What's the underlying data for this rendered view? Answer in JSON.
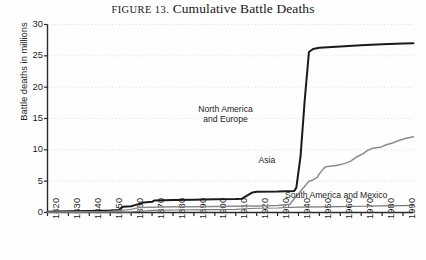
{
  "figure": {
    "title_prefix": "FIGURE 13.",
    "title_main": "Cumulative Battle Deaths"
  },
  "chart_data": {
    "type": "line",
    "title": "FIGURE 13. Cumulative Battle Deaths",
    "xlabel": "",
    "ylabel": "Battle deaths in millions",
    "xlim": [
      1820,
      1995
    ],
    "ylim": [
      0,
      30
    ],
    "yticks": [
      0,
      5,
      10,
      15,
      20,
      25,
      30
    ],
    "xticks": [
      1820,
      1830,
      1840,
      1850,
      1860,
      1870,
      1880,
      1890,
      1900,
      1910,
      1920,
      1930,
      1940,
      1950,
      1960,
      1970,
      1980,
      1990
    ],
    "grid": "horizontal-dotted",
    "legend_position": "inline-annotations",
    "series": [
      {
        "name": "North America and Europe",
        "color": "#1a1a1a",
        "label_x": 1905,
        "label_y": 15.5,
        "points": [
          [
            1820,
            0.1
          ],
          [
            1830,
            0.2
          ],
          [
            1840,
            0.25
          ],
          [
            1850,
            0.3
          ],
          [
            1854,
            0.4
          ],
          [
            1856,
            0.9
          ],
          [
            1860,
            1.0
          ],
          [
            1861,
            1.1
          ],
          [
            1865,
            1.5
          ],
          [
            1866,
            1.6
          ],
          [
            1870,
            1.7
          ],
          [
            1871,
            1.9
          ],
          [
            1880,
            2.0
          ],
          [
            1890,
            2.05
          ],
          [
            1900,
            2.1
          ],
          [
            1910,
            2.15
          ],
          [
            1913,
            2.2
          ],
          [
            1914,
            2.4
          ],
          [
            1918,
            3.2
          ],
          [
            1920,
            3.3
          ],
          [
            1930,
            3.35
          ],
          [
            1938,
            3.45
          ],
          [
            1939,
            4.0
          ],
          [
            1941,
            9.0
          ],
          [
            1943,
            18.0
          ],
          [
            1945,
            25.6
          ],
          [
            1947,
            26.1
          ],
          [
            1950,
            26.3
          ],
          [
            1960,
            26.5
          ],
          [
            1970,
            26.7
          ],
          [
            1980,
            26.85
          ],
          [
            1990,
            26.95
          ],
          [
            1995,
            27.0
          ]
        ]
      },
      {
        "name": "Asia",
        "color": "#8c8c8c",
        "label_x": 1925,
        "label_y": 8.2,
        "points": [
          [
            1820,
            0.05
          ],
          [
            1840,
            0.1
          ],
          [
            1850,
            0.15
          ],
          [
            1855,
            0.3
          ],
          [
            1860,
            0.5
          ],
          [
            1864,
            0.8
          ],
          [
            1870,
            0.85
          ],
          [
            1880,
            0.9
          ],
          [
            1890,
            0.92
          ],
          [
            1900,
            0.95
          ],
          [
            1910,
            1.0
          ],
          [
            1920,
            1.05
          ],
          [
            1930,
            1.1
          ],
          [
            1936,
            1.3
          ],
          [
            1937,
            1.8
          ],
          [
            1940,
            3.0
          ],
          [
            1943,
            4.2
          ],
          [
            1945,
            5.0
          ],
          [
            1947,
            5.2
          ],
          [
            1949,
            5.6
          ],
          [
            1950,
            6.2
          ],
          [
            1952,
            7.0
          ],
          [
            1953,
            7.3
          ],
          [
            1958,
            7.5
          ],
          [
            1962,
            7.8
          ],
          [
            1965,
            8.2
          ],
          [
            1968,
            8.9
          ],
          [
            1971,
            9.4
          ],
          [
            1973,
            9.9
          ],
          [
            1975,
            10.2
          ],
          [
            1979,
            10.4
          ],
          [
            1982,
            10.8
          ],
          [
            1985,
            11.1
          ],
          [
            1988,
            11.5
          ],
          [
            1991,
            11.8
          ],
          [
            1995,
            12.1
          ]
        ]
      },
      {
        "name": "South America and Mexico",
        "color": "#777777",
        "label_x": 1958,
        "label_y": 2.6,
        "points": [
          [
            1820,
            0.02
          ],
          [
            1840,
            0.05
          ],
          [
            1860,
            0.1
          ],
          [
            1865,
            0.2
          ],
          [
            1870,
            0.35
          ],
          [
            1880,
            0.4
          ],
          [
            1900,
            0.45
          ],
          [
            1910,
            0.5
          ],
          [
            1915,
            0.6
          ],
          [
            1920,
            0.68
          ],
          [
            1930,
            0.72
          ],
          [
            1935,
            0.8
          ],
          [
            1940,
            0.85
          ],
          [
            1950,
            0.9
          ],
          [
            1960,
            0.95
          ],
          [
            1970,
            1.0
          ],
          [
            1980,
            1.05
          ],
          [
            1990,
            1.1
          ],
          [
            1995,
            1.15
          ]
        ]
      }
    ]
  }
}
